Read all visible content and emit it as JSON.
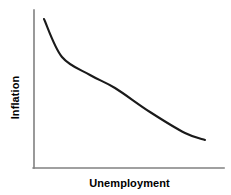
{
  "chart_data": {
    "type": "line",
    "title": "",
    "subtitle": "",
    "xlabel": "Unemployment",
    "ylabel": "Inflation",
    "grid": false,
    "legend": null,
    "legend_position": "none",
    "axis_ticks": [],
    "xtick_labels": [],
    "ytick_labels": [],
    "xlim": [
      0,
      1
    ],
    "ylim": [
      0,
      1
    ],
    "annotations": [],
    "series": [
      {
        "name": "Phillips Curve",
        "color": "#1a1a1a",
        "shape": "convex-decreasing",
        "x": [
          0.05,
          0.15,
          0.3,
          0.43,
          0.61,
          0.8,
          0.9
        ],
        "y": [
          0.94,
          0.7,
          0.59,
          0.51,
          0.35,
          0.22,
          0.18
        ],
        "points_px": [
          [
            44,
            19
          ],
          [
            62,
            57
          ],
          [
            90,
            75
          ],
          [
            115,
            88
          ],
          [
            150,
            112
          ],
          [
            185,
            133
          ],
          [
            205,
            140
          ]
        ]
      }
    ]
  },
  "figure": {
    "width": 231,
    "height": 195,
    "background": "#ffffff",
    "axis_color": "#808080",
    "curve_color": "#1a1a1a",
    "label_color": "#000000"
  },
  "axes": {
    "y_axis_name": "y-axis",
    "x_axis_name": "x-axis",
    "origin_px": [
      34,
      168
    ],
    "y_top_px": 10,
    "x_right_px": 224
  }
}
